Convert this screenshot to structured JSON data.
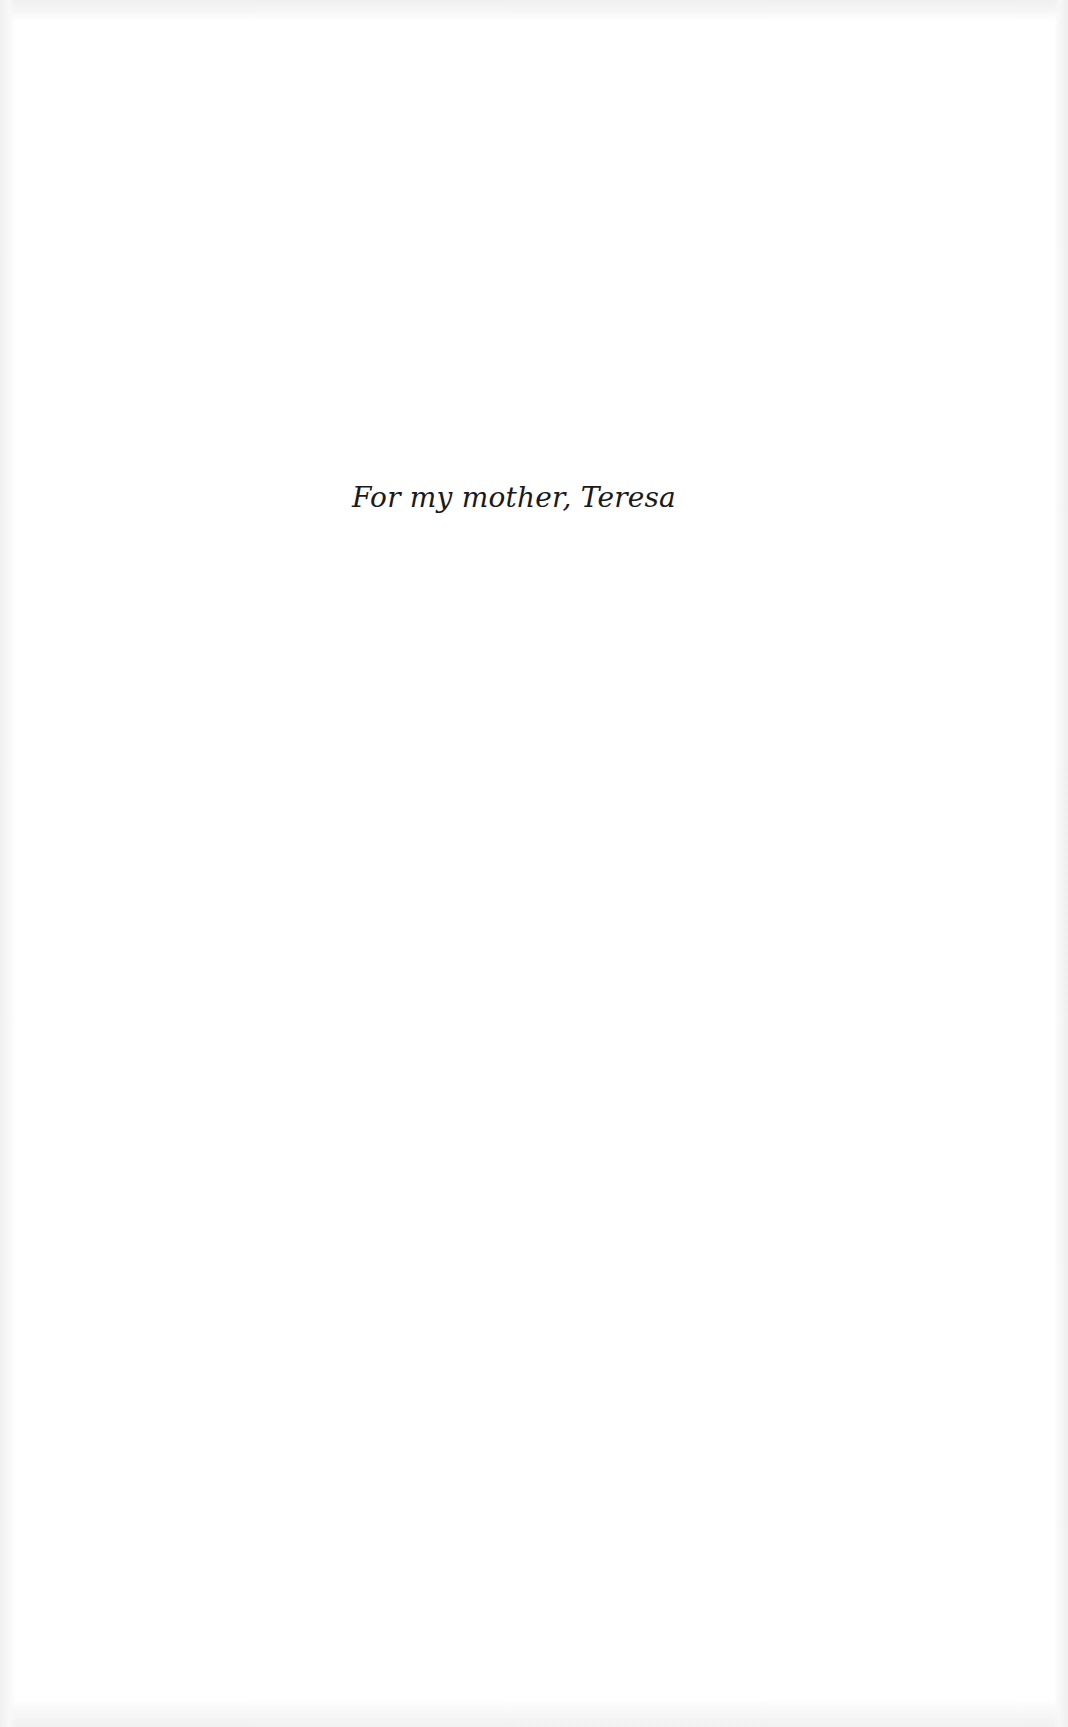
{
  "page": {
    "dedication": "For my mother, Teresa"
  }
}
